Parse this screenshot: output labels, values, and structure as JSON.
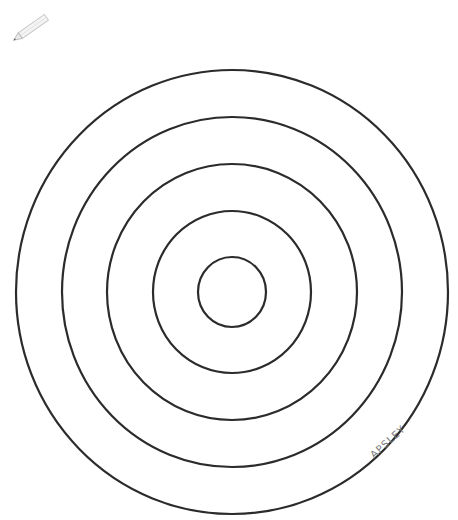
{
  "drawing": {
    "title": "Concentric circles coloring page",
    "signature": "APSLEY",
    "stroke_color": "#2b2b2b",
    "background": "#ffffff",
    "center": {
      "x": 232,
      "y": 292
    },
    "rings": [
      {
        "rx": 216,
        "ry": 222
      },
      {
        "rx": 170,
        "ry": 175
      },
      {
        "rx": 125,
        "ry": 128
      },
      {
        "rx": 79,
        "ry": 81
      },
      {
        "rx": 34,
        "ry": 35
      }
    ]
  },
  "icons": {
    "pencil": "pencil-icon"
  }
}
